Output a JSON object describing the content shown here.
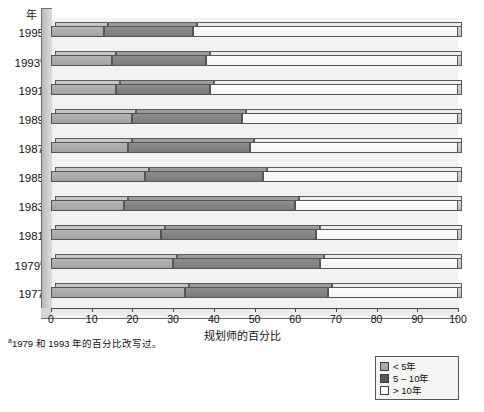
{
  "chart_data": {
    "type": "bar",
    "orientation": "horizontal",
    "stacked": true,
    "title": "",
    "xlabel": "规划师的百分比",
    "ylabel": "年",
    "xlim": [
      0,
      100
    ],
    "xticks": [
      0,
      10,
      20,
      30,
      40,
      50,
      60,
      70,
      80,
      90,
      100
    ],
    "grid": false,
    "legend_position": "bottom-right",
    "categories": [
      "1995",
      "1993ᵃ",
      "1991",
      "1989",
      "1987",
      "1985",
      "1983",
      "1981",
      "1979ᵃ",
      "1977"
    ],
    "series": [
      {
        "name": "< 5年",
        "color": "#a8a8a8",
        "values": [
          13,
          15,
          16,
          20,
          19,
          23,
          18,
          27,
          30,
          33
        ]
      },
      {
        "name": "5 – 10年",
        "color": "#585858",
        "values": [
          22,
          23,
          23,
          27,
          30,
          29,
          42,
          38,
          36,
          35
        ]
      },
      {
        "name": "> 10年",
        "color": "#ffffff",
        "values": [
          65,
          62,
          61,
          53,
          51,
          48,
          40,
          35,
          34,
          32
        ]
      }
    ],
    "annotations": {
      "footnote": "1979 和 1993 年的百分比改写过。",
      "footnote_marker": "a"
    }
  },
  "legend": {
    "items": [
      {
        "label": "< 5年",
        "swatch": "light-gray-swatch"
      },
      {
        "label": "5 – 10年",
        "swatch": "dark-gray-swatch"
      },
      {
        "label": "> 10年",
        "swatch": "white-swatch"
      }
    ]
  }
}
